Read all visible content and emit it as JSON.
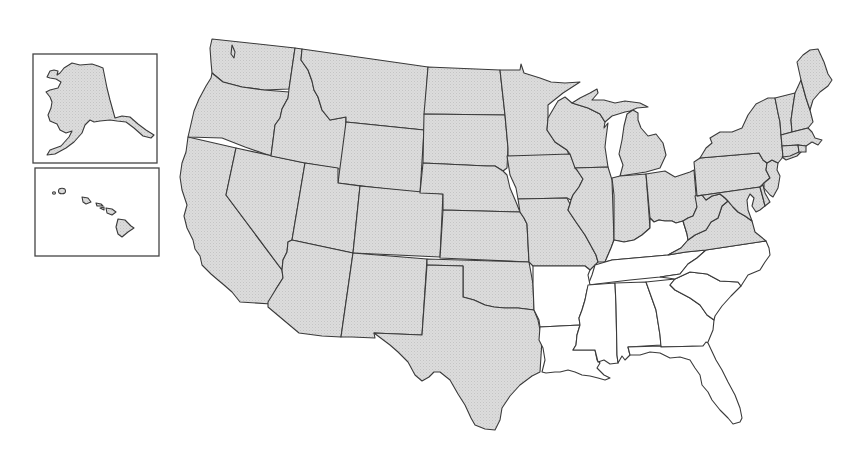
{
  "map": {
    "title": "",
    "description": "Outline map of the United States with states shaded gray except ten southeastern states left white",
    "colors": {
      "shaded_fill": "#d9d9d9",
      "unshaded_fill": "#ffffff",
      "border": "#3a3a3a",
      "background": "#ffffff"
    },
    "legend": [],
    "insets": [
      {
        "name": "Alaska",
        "shaded": true
      },
      {
        "name": "Hawaii",
        "shaded": true
      }
    ],
    "shaded_states": [
      "Washington",
      "Oregon",
      "California",
      "Idaho",
      "Nevada",
      "Montana",
      "Wyoming",
      "Utah",
      "Arizona",
      "Colorado",
      "New Mexico",
      "North Dakota",
      "South Dakota",
      "Nebraska",
      "Kansas",
      "Oklahoma",
      "Texas",
      "Minnesota",
      "Iowa",
      "Missouri",
      "Wisconsin",
      "Illinois",
      "Michigan",
      "Indiana",
      "Ohio",
      "West Virginia",
      "Virginia",
      "Pennsylvania",
      "New York",
      "Maryland",
      "Delaware",
      "New Jersey",
      "Connecticut",
      "Rhode Island",
      "Massachusetts",
      "Vermont",
      "New Hampshire",
      "Maine",
      "Alaska",
      "Hawaii"
    ],
    "unshaded_states": [
      "Kentucky",
      "Tennessee",
      "North Carolina",
      "South Carolina",
      "Georgia",
      "Florida",
      "Alabama",
      "Mississippi",
      "Louisiana",
      "Arkansas"
    ]
  }
}
